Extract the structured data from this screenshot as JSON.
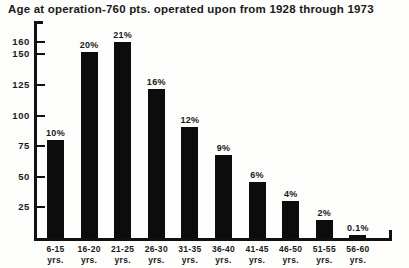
{
  "chart_data": {
    "type": "bar",
    "title": "Age at operation-760 pts. operated upon from 1928 through 1973",
    "xlabel": "",
    "ylabel": "",
    "ylim": [
      0,
      165
    ],
    "grid": false,
    "legend": null,
    "axis_unit_suffix": "yrs.",
    "ytick_labels": [
      "160",
      "150",
      "125",
      "100",
      "75",
      "50",
      "25"
    ],
    "ytick_values": [
      160,
      150,
      125,
      100,
      75,
      50,
      25
    ],
    "categories": [
      "6-15",
      "16-20",
      "21-25",
      "26-30",
      "31-35",
      "36-40",
      "41-45",
      "46-50",
      "51-55",
      "56-60"
    ],
    "values": [
      80,
      152,
      160,
      122,
      91,
      68,
      46,
      30,
      15,
      1
    ],
    "data_labels": [
      "10%",
      "20%",
      "21%",
      "16%",
      "12%",
      "9%",
      "6%",
      "4%",
      "2%",
      "0.1%"
    ],
    "bar_color": "#0c0c0c",
    "axis_color": "#111111",
    "background_color": "#fdfdfb"
  }
}
